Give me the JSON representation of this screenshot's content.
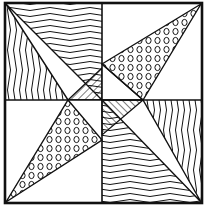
{
  "artwork": {
    "subject": "pinwheel quilt block line drawing",
    "colors": {
      "ink": "#111111",
      "paper": "#ffffff"
    },
    "frame": {
      "x": 5,
      "y": 3,
      "width": 197,
      "height": 200
    },
    "center": {
      "x": 102,
      "y": 100
    },
    "quadrants": [
      {
        "name": "top-left",
        "pattern_outer": "wavy-lines",
        "pattern_blade": "white"
      },
      {
        "name": "top-right",
        "pattern_outer": "white",
        "pattern_blade": "circles"
      },
      {
        "name": "bottom-left",
        "pattern_outer": "white",
        "pattern_blade": "circles"
      },
      {
        "name": "bottom-right",
        "pattern_outer": "wavy-lines",
        "pattern_blade": "white"
      }
    ],
    "center_patterns": [
      "diagonal-hatch",
      "diagonal-hatch"
    ]
  }
}
